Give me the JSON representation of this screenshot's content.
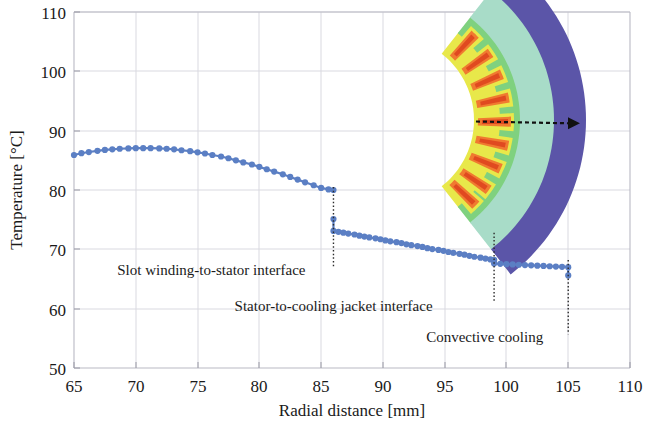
{
  "chart_data": {
    "type": "line",
    "title": "",
    "xlabel": "Radial distance [mm]",
    "ylabel": "Temperature [°C]",
    "xlim": [
      65,
      110
    ],
    "ylim": [
      50,
      110
    ],
    "xticks": [
      65,
      70,
      75,
      80,
      85,
      90,
      95,
      100,
      105,
      110
    ],
    "yticks": [
      50,
      60,
      70,
      80,
      90,
      100,
      110
    ],
    "grid": true,
    "legend": "none",
    "marker": "circle",
    "series": [
      {
        "name": "Slot winding region",
        "color": "#5b7fc4",
        "x": [
          65.0,
          65.6,
          66.2,
          66.9,
          67.5,
          68.1,
          68.7,
          69.4,
          70.0,
          70.6,
          71.2,
          71.9,
          72.5,
          73.1,
          73.7,
          74.4,
          75.0,
          75.6,
          76.2,
          76.9,
          77.5,
          78.1,
          78.7,
          79.4,
          80.0,
          80.6,
          81.2,
          81.9,
          82.5,
          83.1,
          83.7,
          84.4,
          85.0,
          85.6,
          86.0
        ],
        "y": [
          85.9,
          86.2,
          86.4,
          86.6,
          86.75,
          86.85,
          86.95,
          87.0,
          87.05,
          87.05,
          87.05,
          87.0,
          86.95,
          86.85,
          86.7,
          86.55,
          86.35,
          86.15,
          85.9,
          85.65,
          85.35,
          85.0,
          84.65,
          84.3,
          83.9,
          83.5,
          83.1,
          82.65,
          82.2,
          81.75,
          81.3,
          80.8,
          80.35,
          80.1,
          80.0
        ]
      },
      {
        "name": "Stator core region",
        "color": "#5b7fc4",
        "x": [
          86.0,
          86.0,
          86.4,
          86.8,
          87.2,
          87.7,
          88.1,
          88.5,
          88.9,
          89.4,
          89.8,
          90.2,
          90.6,
          91.1,
          91.5,
          91.9,
          92.3,
          92.8,
          93.2,
          93.6,
          94.0,
          94.5,
          94.9,
          95.3,
          95.7,
          96.2,
          96.6,
          97.0,
          97.4,
          97.9,
          98.3,
          98.7,
          99.0
        ],
        "y": [
          75.1,
          73.1,
          72.95,
          72.8,
          72.65,
          72.5,
          72.3,
          72.15,
          72.0,
          71.85,
          71.7,
          71.5,
          71.35,
          71.2,
          71.05,
          70.85,
          70.7,
          70.55,
          70.4,
          70.2,
          70.05,
          69.9,
          69.75,
          69.55,
          69.4,
          69.25,
          69.1,
          68.9,
          68.75,
          68.6,
          68.45,
          68.3,
          68.2
        ]
      },
      {
        "name": "Cooling jacket region",
        "color": "#5b7fc4",
        "x": [
          99.0,
          99.0,
          99.5,
          100.0,
          100.5,
          101.0,
          101.5,
          102.0,
          102.5,
          103.0,
          103.5,
          104.0,
          104.5,
          105.0,
          105.0
        ],
        "y": [
          68.2,
          67.6,
          67.55,
          67.5,
          67.45,
          67.4,
          67.35,
          67.3,
          67.25,
          67.2,
          67.15,
          67.1,
          67.05,
          67.0,
          65.6
        ]
      }
    ],
    "annotations": [
      {
        "name": "slot-winding-to-stator-interface",
        "text": "Slot winding-to-stator interface",
        "x_mm": 86.0,
        "label_x_mm": 68.5,
        "label_y_c": 66.5
      },
      {
        "name": "stator-to-cooling-jacket-interface",
        "text": "Stator-to-cooling jacket interface",
        "x_mm": 99.0,
        "label_x_mm": 78.0,
        "label_y_c": 60.5
      },
      {
        "name": "convective-cooling",
        "text": "Convective cooling",
        "x_mm": 105.0,
        "label_x_mm": 93.5,
        "label_y_c": 55.2
      }
    ]
  },
  "inset": {
    "name": "stator-sector-thermal-contour",
    "description": "Thermal contour of stator sector with windings",
    "arrow_label": "radial-path-arrow",
    "colors": {
      "jacket": "#5b55a8",
      "stator_outer": "#a8dcc8",
      "stator_inner": "#7fd17f",
      "slot_edge": "#e8e84a",
      "slot_core": "#f07a30",
      "slot_hot": "#e04a20"
    }
  }
}
